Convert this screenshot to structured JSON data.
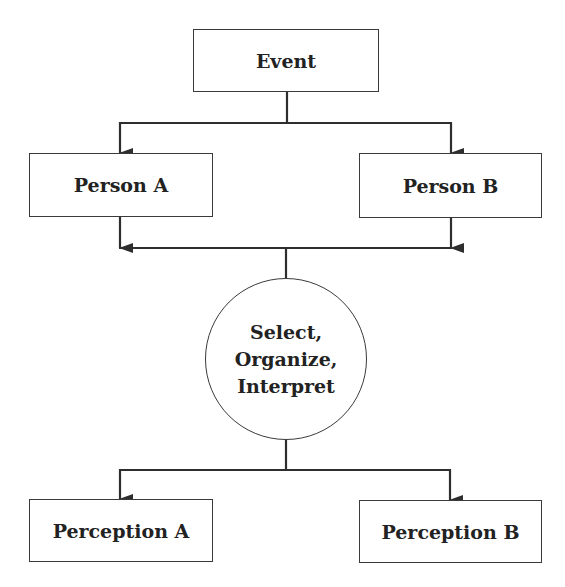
{
  "diagram": {
    "type": "flowchart",
    "colors": {
      "stroke": "#2e2e2e",
      "text": "#222222",
      "background": "#ffffff"
    },
    "nodes": {
      "event": {
        "label": "Event",
        "shape": "rectangle"
      },
      "person_a": {
        "label": "Person A",
        "shape": "rectangle"
      },
      "person_b": {
        "label": "Person B",
        "shape": "rectangle"
      },
      "process": {
        "shape": "circle",
        "lines": [
          "Select,",
          "Organize,",
          "Interpret"
        ]
      },
      "perception_a": {
        "label": "Perception A",
        "shape": "rectangle"
      },
      "perception_b": {
        "label": "Perception B",
        "shape": "rectangle"
      }
    },
    "edges": [
      {
        "from": "Event",
        "to": "Person A"
      },
      {
        "from": "Event",
        "to": "Person B"
      },
      {
        "from": "Person A",
        "to": "Select, Organize, Interpret"
      },
      {
        "from": "Person B",
        "to": "Select, Organize, Interpret"
      },
      {
        "from": "Select, Organize, Interpret",
        "to": "Perception A"
      },
      {
        "from": "Select, Organize, Interpret",
        "to": "Perception B"
      }
    ]
  }
}
